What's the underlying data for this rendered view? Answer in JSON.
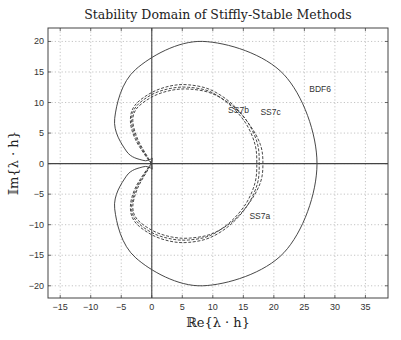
{
  "chart_data": {
    "type": "line",
    "title": "Stability Domain of Stiffly-Stable Methods",
    "xlabel": "ℝe{λ · h}",
    "ylabel": "𝕀m{λ · h}",
    "xlim": [
      -17,
      38.7
    ],
    "ylim": [
      -22,
      22.2
    ],
    "xticks": [
      -15,
      -10,
      -5,
      0,
      5,
      10,
      15,
      20,
      25,
      30,
      35
    ],
    "yticks": [
      -20,
      -15,
      -10,
      -5,
      0,
      5,
      10,
      15,
      20
    ],
    "grid": true,
    "series": [
      {
        "name": "BDF6",
        "style": "solid",
        "mirror_about_x_axis": true,
        "points_upper": [
          [
            0,
            0
          ],
          [
            0.02,
            0.26
          ],
          [
            0.059,
            0.909
          ],
          [
            -0.168,
            0.721
          ],
          [
            -1.467,
            0.534
          ],
          [
            -4.18,
            2.06
          ],
          [
            -6.075,
            7.405
          ],
          [
            -2.62,
            15.44
          ],
          [
            8.315,
            20.0
          ],
          [
            21.64,
            14.59
          ],
          [
            27.07,
            0
          ]
        ]
      },
      {
        "name": "SS7a",
        "style": "dashed",
        "mirror_about_x_axis": true,
        "points_upper": [
          [
            0,
            0
          ],
          [
            -0.6,
            0.8
          ],
          [
            -2.5,
            4
          ],
          [
            -3.3,
            7
          ],
          [
            -2.6,
            9.3
          ],
          [
            0,
            11.3
          ],
          [
            3,
            12.3
          ],
          [
            6,
            12.5
          ],
          [
            9.5,
            11.8
          ],
          [
            12.8,
            9.6
          ],
          [
            15.4,
            6.6
          ],
          [
            16.9,
            3.2
          ],
          [
            17.2,
            0
          ]
        ]
      },
      {
        "name": "SS7b",
        "style": "dashed",
        "mirror_about_x_axis": true,
        "points_upper": [
          [
            0,
            0
          ],
          [
            -0.7,
            0.8
          ],
          [
            -2.7,
            4
          ],
          [
            -3.5,
            7
          ],
          [
            -2.8,
            9.5
          ],
          [
            -0.1,
            11.6
          ],
          [
            3,
            12.7
          ],
          [
            6,
            12.9
          ],
          [
            9.6,
            12.1
          ],
          [
            13.0,
            9.9
          ],
          [
            15.7,
            6.8
          ],
          [
            17.3,
            3.3
          ],
          [
            17.6,
            0
          ]
        ]
      },
      {
        "name": "SS7c",
        "style": "dashed",
        "mirror_about_x_axis": true,
        "points_upper": [
          [
            0,
            0
          ],
          [
            -0.5,
            0.8
          ],
          [
            -2.3,
            4
          ],
          [
            -3.1,
            7
          ],
          [
            -2.4,
            9.1
          ],
          [
            0.2,
            11.0
          ],
          [
            3.2,
            12.0
          ],
          [
            6.2,
            12.2
          ],
          [
            9.8,
            11.5
          ],
          [
            13.3,
            9.4
          ],
          [
            16.0,
            6.4
          ],
          [
            17.8,
            3.1
          ],
          [
            18.2,
            0
          ]
        ]
      }
    ],
    "annotations": [
      {
        "text": "BDF6",
        "x": 25.8,
        "y": 11.8
      },
      {
        "text": "SS7b",
        "x": 12.5,
        "y": 8.3
      },
      {
        "text": "SS7c",
        "x": 17.8,
        "y": 8.0
      },
      {
        "text": "SS7a",
        "x": 16.0,
        "y": -9.1
      }
    ]
  }
}
